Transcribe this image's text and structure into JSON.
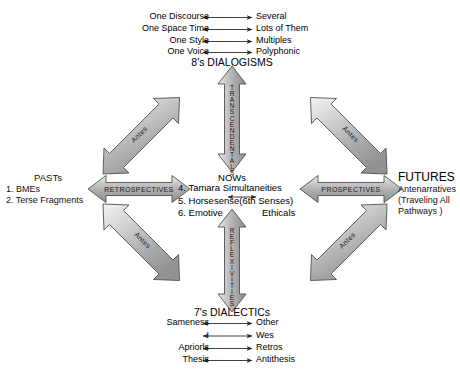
{
  "diagram": {
    "title_top": "8's DIALOGISMS",
    "title_bottom": "7's DIALECTICs",
    "top_pairs": [
      {
        "left": "One Discourse",
        "right": "Several"
      },
      {
        "left": "One Space Time",
        "right": "Lots of Them"
      },
      {
        "left": "One Style",
        "right": "Multiples"
      },
      {
        "left": "One Voice",
        "right": "Polyphonic"
      }
    ],
    "bottom_pairs": [
      {
        "left": "Sameness",
        "right": "Other"
      },
      {
        "left": "I",
        "right": "Wes"
      },
      {
        "left": "Apriorls",
        "right": "Retros"
      },
      {
        "left": "Thesis",
        "right": "Antithesis"
      }
    ],
    "left_block": {
      "heading": "PASTs",
      "items": [
        "1. BMEs",
        "2. Terse Fragments"
      ]
    },
    "right_block": {
      "heading": "FUTURES",
      "items": [
        "Antenarratives",
        "(Traveling All",
        "Pathways )"
      ]
    },
    "center_block": {
      "heading": "NOWs",
      "line1": "4. Tamara Simultaneities",
      "line2": "5. Horsesense(6th Senses)",
      "line3_left": "6. Emotive",
      "line3_right": "Ethicals"
    },
    "arrows": {
      "vertical_up": "TRANSCENDENTALS",
      "vertical_down": "REFLEXIVITIES",
      "horizontal_left": "RETROSPECTIVES",
      "horizontal_right": "PROSPECTIVES",
      "diagonal_nw": "Antes",
      "diagonal_ne": "Antes",
      "diagonal_sw": "Antes",
      "diagonal_se": "Antes"
    },
    "colors": {
      "arrow_fill": "#b4b4b4",
      "arrow_stroke": "#5a5a5a",
      "background": "#ffffff",
      "text": "#111111"
    }
  }
}
